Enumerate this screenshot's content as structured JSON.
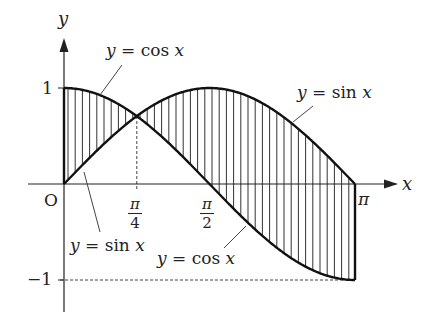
{
  "diagram": {
    "axes": {
      "x_label": "x",
      "y_label": "y",
      "origin_label": "O"
    },
    "y_ticks": [
      {
        "value": 1,
        "label": "1"
      },
      {
        "value": -1,
        "label": "−1"
      }
    ],
    "x_ticks": [
      {
        "value": "π/4",
        "numerator": "π",
        "denominator": "4"
      },
      {
        "value": "π/2",
        "numerator": "π",
        "denominator": "2"
      },
      {
        "value": "π",
        "label": "π"
      }
    ],
    "curve_labels": {
      "cos_top": {
        "y": "y",
        "eq": "=",
        "fn": "cos",
        "x": "x"
      },
      "sin_top": {
        "y": "y",
        "eq": "=",
        "fn": "sin",
        "x": "x"
      },
      "sin_bottom": {
        "y": "y",
        "eq": "=",
        "fn": "sin",
        "x": "x"
      },
      "cos_bottom": {
        "y": "y",
        "eq": "=",
        "fn": "cos",
        "x": "x"
      }
    },
    "shading": "vertical hatching between y = sin x and y = cos x over [0, π]",
    "colors": {
      "ink": "#222222",
      "background": "#ffffff"
    }
  }
}
